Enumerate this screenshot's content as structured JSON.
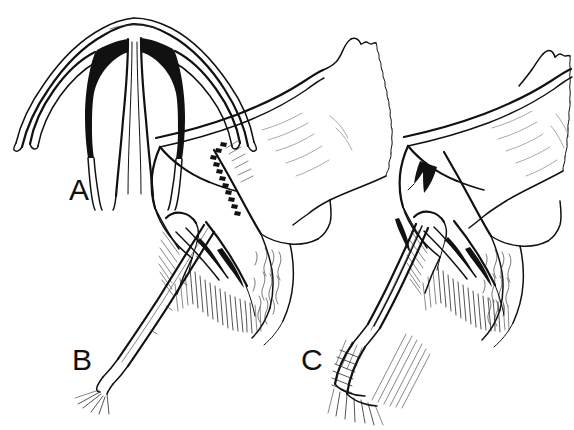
{
  "figure": {
    "background_color": "#ffffff",
    "ink_color": "#111111",
    "width": 574,
    "height": 430,
    "style": "pen-and-ink medical illustration, black line art on white"
  },
  "panels": [
    {
      "id": "A",
      "label": "A",
      "label_x": 69,
      "label_y": 175,
      "view": "frontal cross-section",
      "description": "Coronal cross-section of nasal septum and upper lateral cartilages forming an inverted-Y / trident outline with two solid black wedge-shaped voids flanking the central septal stem",
      "features": [
        "dome-shaped upper arch",
        "two lateral wings curving down and outward",
        "solid black triangular wedges at the junction of septum and lateral cartilages",
        "central vertical septal stem descending to lower edge"
      ]
    },
    {
      "id": "B",
      "label": "B",
      "label_x": 72,
      "label_y": 345,
      "view": "sagittal section",
      "description": "Lateral sagittal view of nasal dorsum and nasal bone with a straight surgical elevator inserted from lower left; a dashed serrated line marks the planned osteotomy / incision along the upper lateral cartilage",
      "features": [
        "nasal dorsum profile with torn jagged posterior edge",
        "dashed incision line",
        "cross-hatched mucosa and soft tissue shading",
        "straight-shaft elevator instrument entering from lower left"
      ],
      "instrument": "periosteal elevator",
      "marker": "dashed incision line"
    },
    {
      "id": "C",
      "label": "C",
      "label_x": 301,
      "label_y": 345,
      "view": "sagittal section",
      "description": "Same lateral sagittal view with a grasping forceps/clamp engaging the cartilage; a solid black arrowhead points down-left at the repositioned dorsal segment",
      "features": [
        "nasal dorsum profile with torn jagged posterior edge",
        "solid black arrowhead indicator",
        "cross-hatched mucosa and soft tissue shading",
        "angled forceps / clamp instrument with cross-hatched handle at lower left"
      ],
      "instrument": "grasping forceps / clamp",
      "marker": "solid black arrowhead"
    }
  ],
  "annotations": {
    "arrow_color": "#111111",
    "arrow_panel": "C",
    "arrow_direction": "down-left",
    "incision_line_panel": "B",
    "incision_line_style": "dashed / serrated"
  }
}
